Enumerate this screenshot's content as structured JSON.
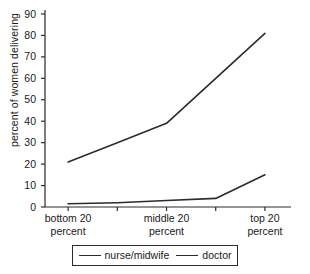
{
  "chart_data": {
    "type": "line",
    "title": "",
    "xlabel": "",
    "ylabel": "percent of women delivering",
    "categories": [
      "bottom 20 percent",
      "",
      "middle 20 percent",
      "",
      "top 20 percent"
    ],
    "x_tick_labels": [
      {
        "line1": "bottom 20",
        "line2": "percent"
      },
      {
        "line1": "middle 20",
        "line2": "percent"
      },
      {
        "line1": "top 20",
        "line2": "percent"
      }
    ],
    "x_labeled_tick_indices": [
      0,
      2,
      4
    ],
    "x_tick_count": 5,
    "y_ticks": [
      0,
      10,
      20,
      30,
      40,
      50,
      60,
      70,
      80,
      90
    ],
    "ylim": [
      0,
      90
    ],
    "grid": false,
    "legend_position": "bottom",
    "series": [
      {
        "name": "nurse/midwife",
        "color": "#2b2b2b",
        "values": [
          21,
          30,
          39,
          60,
          81
        ]
      },
      {
        "name": "doctor",
        "color": "#2b2b2b",
        "values": [
          1.5,
          2,
          3,
          4,
          15
        ]
      }
    ]
  },
  "legend": {
    "items": [
      {
        "label": "nurse/midwife"
      },
      {
        "label": "doctor"
      }
    ]
  },
  "colors": {
    "axis": "#2b2b2b",
    "line": "#2b2b2b",
    "background": "#ffffff"
  }
}
